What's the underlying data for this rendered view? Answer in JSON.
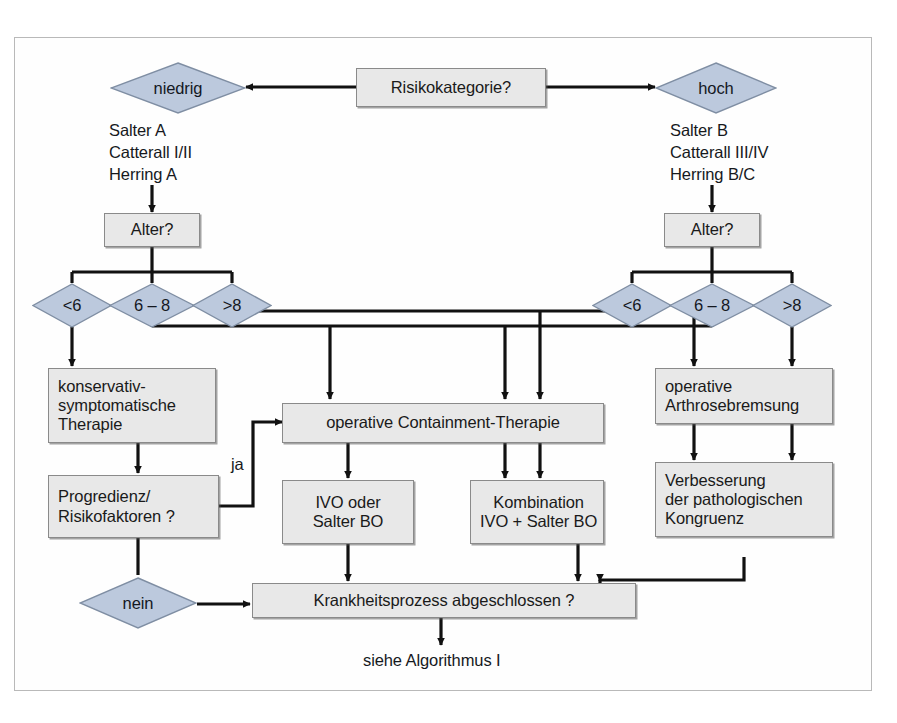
{
  "diagram": {
    "title_text": "Risikokategorie?",
    "language": "de",
    "colors": {
      "box_fill": "#e8e8e8",
      "box_border": "#8a8a8a",
      "diamond_fill": "#bcc9dd",
      "diamond_border": "#7f8ea3",
      "line": "#111111",
      "frame_border": "#b9b9b9",
      "text": "#16191d"
    },
    "nodes": {
      "risikokategorie": "Risikokategorie?",
      "niedrig": "niedrig",
      "hoch": "hoch",
      "alter_left": "Alter?",
      "alter_right": "Alter?",
      "left_lt6": "<6",
      "left_6_8": "6 – 8",
      "left_gt8": ">8",
      "right_lt6": "<6",
      "right_6_8": "6 – 8",
      "right_gt8": ">8",
      "konservativ": "konservativ-\nsymptomatische\nTherapie",
      "progredienz": "Progredienz/\nRisikofaktoren ?",
      "nein": "nein",
      "containment": "operative Containment-Therapie",
      "ivo_oder": "IVO oder\nSalter BO",
      "kombination": "Kombination\nIVO + Salter BO",
      "arthrosebremsung": "operative\nArthrosebremsung",
      "kongruenz": "Verbesserung\nder pathologischen\nKongruenz",
      "krankheitsprozess": "Krankheitsprozess abgeschlossen ?",
      "siehe_algorithmus": "siehe Algorithmus I"
    },
    "captions": {
      "left_criteria": "Salter A\nCatterall I/II\nHerring A",
      "right_criteria": "Salter B\nCatterall III/IV\nHerring B/C"
    },
    "edge_labels": {
      "ja": "ja"
    }
  }
}
